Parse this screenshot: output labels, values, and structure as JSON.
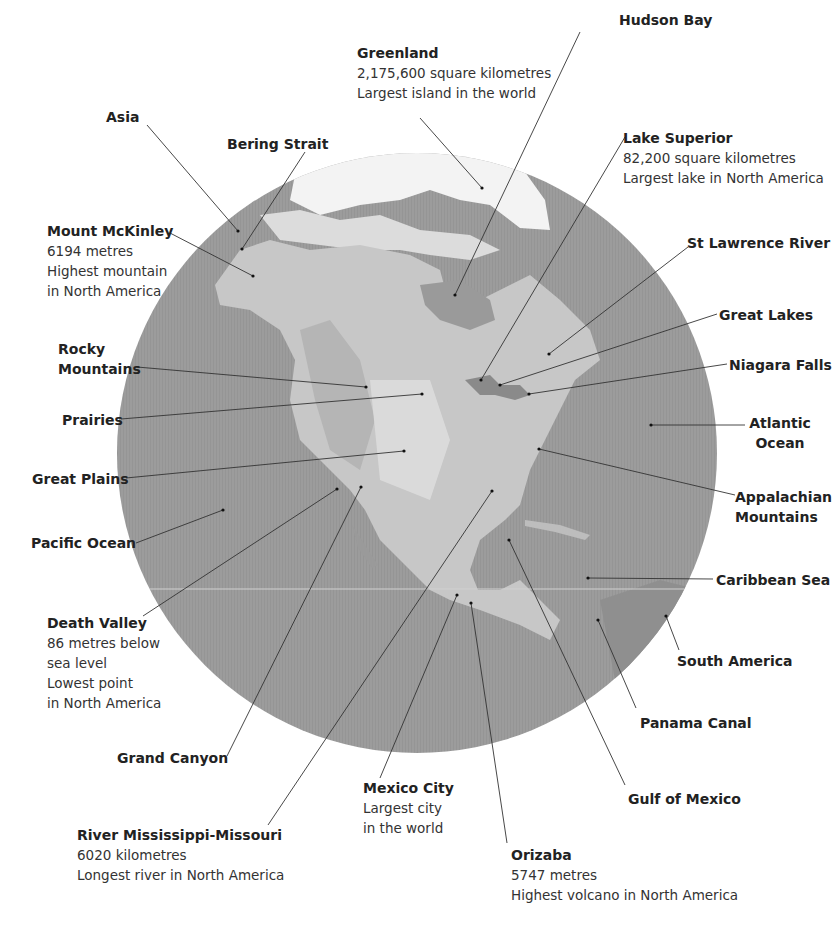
{
  "diagram": {
    "globe": {
      "cx": 417,
      "cy": 453,
      "r": 300,
      "ocean_color": "#9a9a9a",
      "land_color": "#c9c9c9",
      "ice_color": "#f2f2f2"
    }
  },
  "labels": [
    {
      "id": "greenland",
      "title": "Greenland",
      "lines": [
        "2,175,600 square kilometres",
        "Largest island in the world"
      ]
    },
    {
      "id": "hudson-bay",
      "title": "Hudson Bay",
      "lines": []
    },
    {
      "id": "asia",
      "title": "Asia",
      "lines": []
    },
    {
      "id": "bering-strait",
      "title": "Bering Strait",
      "lines": []
    },
    {
      "id": "lake-superior",
      "title": "Lake Superior",
      "lines": [
        "82,200 square kilometres",
        "Largest lake in North America"
      ]
    },
    {
      "id": "mount-mckinley",
      "title": "Mount McKinley",
      "lines": [
        "6194 metres",
        "Highest mountain",
        "in North America"
      ]
    },
    {
      "id": "st-lawrence-river",
      "title": "St Lawrence River",
      "lines": []
    },
    {
      "id": "great-lakes",
      "title": "Great Lakes",
      "lines": []
    },
    {
      "id": "rocky-mountains",
      "title": "Rocky Mountains",
      "lines": []
    },
    {
      "id": "niagara-falls",
      "title": "Niagara Falls",
      "lines": []
    },
    {
      "id": "prairies",
      "title": "Prairies",
      "lines": []
    },
    {
      "id": "atlantic-ocean",
      "title": "Atlantic Ocean",
      "lines": []
    },
    {
      "id": "great-plains",
      "title": "Great Plains",
      "lines": []
    },
    {
      "id": "appalachian-mountains",
      "title": "Appalachian Mountains",
      "lines": []
    },
    {
      "id": "pacific-ocean",
      "title": "Pacific Ocean",
      "lines": []
    },
    {
      "id": "caribbean-sea",
      "title": "Caribbean Sea",
      "lines": []
    },
    {
      "id": "death-valley",
      "title": "Death Valley",
      "lines": [
        "86 metres below",
        "sea level",
        "Lowest point",
        "in North America"
      ]
    },
    {
      "id": "south-america",
      "title": "South America",
      "lines": []
    },
    {
      "id": "panama-canal",
      "title": "Panama Canal",
      "lines": []
    },
    {
      "id": "grand-canyon",
      "title": "Grand Canyon",
      "lines": []
    },
    {
      "id": "mexico-city",
      "title": "Mexico City",
      "lines": [
        "Largest city",
        "in the world"
      ]
    },
    {
      "id": "gulf-of-mexico",
      "title": "Gulf of Mexico",
      "lines": []
    },
    {
      "id": "river-mississippi-missouri",
      "title": "River Mississippi-Missouri",
      "lines": [
        "6020 kilometres",
        "Longest river in North America"
      ]
    },
    {
      "id": "orizaba",
      "title": "Orizaba",
      "lines": [
        "5747 metres",
        "Highest volcano in North America"
      ]
    }
  ]
}
